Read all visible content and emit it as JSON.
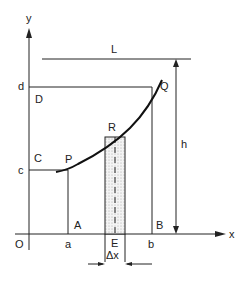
{
  "diagram": {
    "axes": {
      "origin_label": "O",
      "x_label": "x",
      "y_label": "y"
    },
    "x_ticks": {
      "a": "a",
      "e": "E",
      "b": "b"
    },
    "y_ticks": {
      "c": "c",
      "d": "d"
    },
    "points": {
      "P": "P",
      "Q": "Q",
      "R": "R",
      "A": "A",
      "B": "B",
      "C": "C",
      "D": "D"
    },
    "line_L_label": "L",
    "height_label": "h",
    "strip_width_label": "Δx",
    "colors": {
      "line": "#222222",
      "curve": "#111111",
      "strip_fill": "#e6e6e6"
    }
  }
}
